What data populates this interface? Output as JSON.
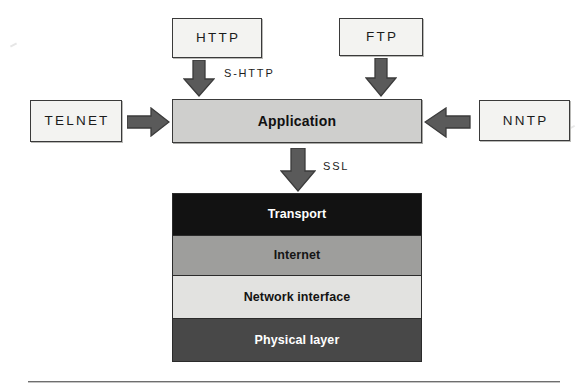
{
  "diagram": {
    "colors": {
      "protocol_box_fill": "#f3f3f1",
      "application_fill": "#cfcfcd",
      "transport_fill": "#121212",
      "internet_fill": "#9e9e9c",
      "network_interface_fill": "#e2e2e0",
      "physical_fill": "#484848",
      "arrow_fill": "#5a5a5a",
      "border": "#3a3a3a"
    },
    "protocols": [
      {
        "id": "http",
        "label": "HTTP",
        "position": "top-left"
      },
      {
        "id": "ftp",
        "label": "FTP",
        "position": "top-right"
      },
      {
        "id": "telnet",
        "label": "TELNET",
        "position": "left"
      },
      {
        "id": "nntp",
        "label": "NNTP",
        "position": "right"
      }
    ],
    "application": {
      "label": "Application"
    },
    "stack": {
      "layers": [
        {
          "id": "transport",
          "label": "Transport"
        },
        {
          "id": "internet",
          "label": "Internet"
        },
        {
          "id": "network-interface",
          "label": "Network interface"
        },
        {
          "id": "physical",
          "label": "Physical layer"
        }
      ]
    },
    "arrows": [
      {
        "id": "http-to-application",
        "label": "S-HTTP",
        "direction": "down"
      },
      {
        "id": "ftp-to-application",
        "label": "",
        "direction": "down"
      },
      {
        "id": "telnet-to-application",
        "label": "",
        "direction": "right"
      },
      {
        "id": "nntp-to-application",
        "label": "",
        "direction": "left"
      },
      {
        "id": "application-to-transport",
        "label": "SSL",
        "direction": "down"
      }
    ]
  }
}
